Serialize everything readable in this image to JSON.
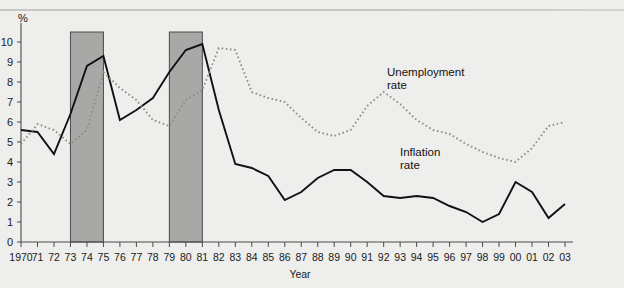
{
  "figure": {
    "y_unit_label": "%",
    "x_axis_title": "Year"
  },
  "series_labels": {
    "unemployment_line1": "Unemployment",
    "unemployment_line2": "rate",
    "inflation_line1": "Inflation",
    "inflation_line2": "rate"
  },
  "colors": {
    "background": "#eeeeec",
    "inflation_line": "#111111",
    "unemployment_line": "#8d8d8a",
    "recession_band": "#a8a8a6",
    "axis": "#4a4a4a"
  },
  "chart_data": {
    "type": "line",
    "title": "",
    "xlabel": "Year",
    "ylabel": "%",
    "ylim": [
      0,
      10.5
    ],
    "yticks": [
      0,
      1,
      2,
      3,
      4,
      5,
      6,
      7,
      8,
      9,
      10
    ],
    "ytick_labels": [
      "0",
      "1",
      "2",
      "3",
      "4",
      "5",
      "6",
      "7",
      "8",
      "9",
      "10"
    ],
    "grid": false,
    "legend_position": "inline-annotation",
    "x": [
      1970,
      1971,
      1972,
      1973,
      1974,
      1975,
      1976,
      1977,
      1978,
      1979,
      1980,
      1981,
      1982,
      1983,
      1984,
      1985,
      1986,
      1987,
      1988,
      1989,
      1990,
      1991,
      1992,
      1993,
      1994,
      1995,
      1996,
      1997,
      1998,
      1999,
      2000,
      2001,
      2002,
      2003
    ],
    "xtick_labels": [
      "1970",
      "71",
      "72",
      "73",
      "74",
      "75",
      "76",
      "77",
      "78",
      "79",
      "80",
      "81",
      "82",
      "83",
      "84",
      "85",
      "86",
      "87",
      "88",
      "89",
      "90",
      "91",
      "92",
      "93",
      "94",
      "95",
      "96",
      "97",
      "98",
      "99",
      "00",
      "01",
      "02",
      "03"
    ],
    "series": [
      {
        "name": "Inflation rate",
        "style": "solid",
        "values": [
          5.6,
          5.5,
          4.4,
          6.4,
          8.8,
          9.3,
          6.1,
          6.6,
          7.2,
          8.5,
          9.6,
          9.9,
          6.6,
          3.9,
          3.7,
          3.3,
          2.1,
          2.5,
          3.2,
          3.6,
          3.6,
          3.0,
          2.3,
          2.2,
          2.3,
          2.2,
          1.8,
          1.5,
          1.0,
          1.4,
          3.0,
          2.5,
          1.2,
          1.9
        ]
      },
      {
        "name": "Unemployment rate",
        "style": "dotted",
        "values": [
          4.9,
          5.9,
          5.6,
          4.9,
          5.6,
          8.5,
          7.7,
          7.1,
          6.1,
          5.8,
          7.1,
          7.6,
          9.7,
          9.6,
          7.5,
          7.2,
          7.0,
          6.2,
          5.5,
          5.3,
          5.6,
          6.8,
          7.5,
          6.9,
          6.1,
          5.6,
          5.4,
          4.9,
          4.5,
          4.2,
          4.0,
          4.7,
          5.8,
          6.0
        ]
      }
    ],
    "annotations": [
      {
        "label": "Unemployment rate",
        "series": "Unemployment rate"
      },
      {
        "label": "Inflation rate",
        "series": "Inflation rate"
      }
    ],
    "shaded_regions": [
      {
        "label": "recession-band-1",
        "x_start": 1973,
        "x_end": 1975
      },
      {
        "label": "recession-band-2",
        "x_start": 1979,
        "x_end": 1981
      }
    ]
  }
}
